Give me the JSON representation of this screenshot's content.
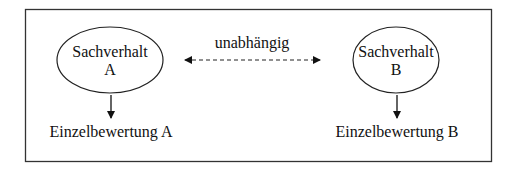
{
  "diagram": {
    "node_a": {
      "line1": "Sachverhalt",
      "line2": "A"
    },
    "node_b": {
      "line1": "Sachverhalt",
      "line2": "B"
    },
    "connector_label": "unabhängig",
    "result_a": "Einzelbewertung A",
    "result_b": "Einzelbewertung B"
  }
}
